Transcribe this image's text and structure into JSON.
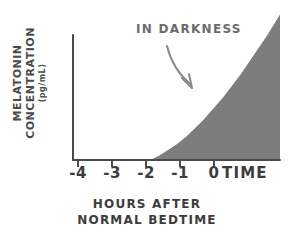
{
  "chart_data": {
    "type": "area",
    "title": "",
    "xlabel": "HOURS AFTER NORMAL BEDTIME",
    "xlabel_line1": "HOURS AFTER",
    "xlabel_line2": "NORMAL BEDTIME",
    "ylabel": "MELATONIN CONCENTRATION",
    "ylabel_units": "(pg/mL)",
    "axis_end_label": "TIME",
    "annotation": "IN DARKNESS",
    "xticks": [
      "-4",
      "-3",
      "-2",
      "-1",
      "0"
    ],
    "xtick_values": [
      -4,
      -3,
      -2,
      -1,
      0
    ],
    "xlim": [
      -4.15,
      1.6
    ],
    "ylim": [
      0,
      100
    ],
    "grid": false,
    "legend": false,
    "yticks_shown": false,
    "series": [
      {
        "name": "Melatonin concentration",
        "x": [
          -2.0,
          -1.75,
          -1.5,
          -1.25,
          -1.0,
          -0.75,
          -0.5,
          -0.25,
          0.0,
          0.25,
          0.5,
          0.75,
          1.0,
          1.25,
          1.6
        ],
        "values": [
          0,
          3,
          7,
          11,
          16,
          22,
          28,
          35,
          42,
          50,
          58,
          67,
          76,
          85,
          99
        ],
        "fill": true,
        "fill_color": "#7d7d7d"
      }
    ],
    "onset_x": -2.0,
    "colors": {
      "fill": "#7d7d7d",
      "axis": "#4a4a4a",
      "text": "#3c3c3c",
      "annotation": "#6b6b6b",
      "background": "#ffffff"
    }
  }
}
